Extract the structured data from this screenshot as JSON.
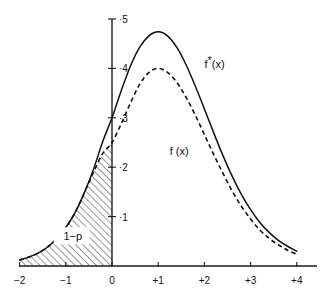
{
  "figure": {
    "title": "",
    "background_color": "#ffffff",
    "ink_color": "#111111"
  },
  "axes": {
    "y_axis": {
      "name": "y-axis",
      "ticks": [
        {
          "value": 0.5,
          "label": "·5"
        },
        {
          "value": 0.4,
          "label": "·4"
        },
        {
          "value": 0.3,
          "label": "·3"
        },
        {
          "value": 0.2,
          "label": "·2"
        },
        {
          "value": 0.1,
          "label": "·1"
        }
      ],
      "range": [
        0.0,
        0.52
      ],
      "label": ""
    },
    "x_axis": {
      "name": "x-axis",
      "ticks": [
        {
          "value": -2,
          "label": "−2"
        },
        {
          "value": -1,
          "label": "−1"
        },
        {
          "value": 0,
          "label": "0"
        },
        {
          "value": 1,
          "label": "+1"
        },
        {
          "value": 2,
          "label": "+2"
        },
        {
          "value": 3,
          "label": "+3"
        },
        {
          "value": 4,
          "label": "+4"
        }
      ],
      "range": [
        -2,
        4
      ],
      "label": ""
    }
  },
  "annotations": {
    "curve_star_label": "f",
    "curve_star_superscript": "*",
    "curve_star_arg": "(x)",
    "curve_plain_label": "f (x)",
    "area_label": "1−p"
  },
  "chart_data": {
    "type": "line",
    "title": "",
    "xlabel": "",
    "ylabel": "",
    "xlim": [
      -2,
      4
    ],
    "ylim": [
      0,
      0.52
    ],
    "grid": false,
    "legend": "inline-annotations",
    "x": [
      -2.0,
      -1.8,
      -1.6,
      -1.4,
      -1.2,
      -1.0,
      -0.8,
      -0.6,
      -0.4,
      -0.2,
      0.0,
      0.2,
      0.4,
      0.6,
      0.8,
      1.0,
      1.2,
      1.4,
      1.6,
      1.8,
      2.0,
      2.2,
      2.4,
      2.6,
      2.8,
      3.0,
      3.2,
      3.4,
      3.6,
      3.8,
      4.0
    ],
    "series": [
      {
        "name": "f*(x)",
        "style": "solid",
        "label_position": {
          "x": 2.0,
          "y": 0.4
        },
        "values": [
          0.012,
          0.018,
          0.026,
          0.038,
          0.055,
          0.078,
          0.108,
          0.148,
          0.196,
          0.252,
          0.3,
          0.355,
          0.405,
          0.443,
          0.466,
          0.474,
          0.466,
          0.443,
          0.408,
          0.365,
          0.318,
          0.27,
          0.224,
          0.182,
          0.145,
          0.114,
          0.088,
          0.068,
          0.052,
          0.04,
          0.03
        ]
      },
      {
        "name": "f(x)",
        "style": "dashed",
        "label_position": {
          "x": 1.25,
          "y": 0.225
        },
        "values": [
          0.012,
          0.018,
          0.026,
          0.038,
          0.055,
          0.078,
          0.108,
          0.148,
          0.19,
          0.228,
          0.25,
          0.288,
          0.33,
          0.368,
          0.392,
          0.4,
          0.392,
          0.372,
          0.342,
          0.306,
          0.266,
          0.226,
          0.188,
          0.152,
          0.121,
          0.095,
          0.073,
          0.056,
          0.043,
          0.032,
          0.024
        ]
      }
    ],
    "shaded_region": {
      "name": "1-p",
      "label": "1−p",
      "hatch": "diagonal-45",
      "x_from": -2,
      "x_to": 0,
      "bounded_by": "f(x)",
      "label_position": {
        "x": -0.85,
        "y": 0.052
      }
    }
  }
}
